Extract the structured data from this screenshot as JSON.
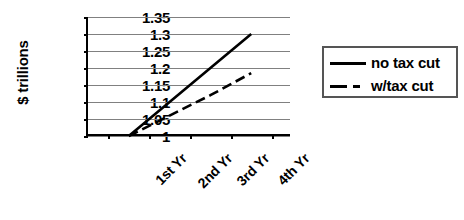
{
  "chart_data": {
    "type": "line",
    "title": "",
    "xlabel": "",
    "ylabel": "$ trillions",
    "categories": [
      "1st Yr",
      "2nd Yr",
      "3rd Yr",
      "4th Yr"
    ],
    "series": [
      {
        "name": "no tax cut",
        "style": "solid",
        "values": [
          1.0,
          1.1,
          1.2,
          1.3
        ]
      },
      {
        "name": "w/tax cut",
        "style": "dashed",
        "values": [
          1.0,
          1.06,
          1.12,
          1.185
        ]
      }
    ],
    "ylim": [
      1,
      1.35
    ],
    "yticks": [
      "1.35",
      "1.3",
      "1.25",
      "1.2",
      "1.15",
      "1.1",
      "1.05",
      "1"
    ],
    "ytick_values": [
      1.35,
      1.3,
      1.25,
      1.2,
      1.15,
      1.1,
      1.05,
      1
    ],
    "grid": true,
    "legend_position": "right",
    "colors": {
      "line": "#000000",
      "gridline": "#808080",
      "axis": "#000000",
      "background": "#ffffff",
      "legend_border": "#555555"
    }
  },
  "legend": {
    "entries": [
      {
        "label": "no tax cut",
        "style": "solid"
      },
      {
        "label": "w/tax cut",
        "style": "dashed"
      }
    ]
  },
  "axes": {
    "y_title": "$ trillions",
    "y_tick_labels": [
      "1.35",
      "1.3",
      "1.25",
      "1.2",
      "1.15",
      "1.1",
      "1.05",
      "1"
    ],
    "x_tick_labels": [
      "1st Yr",
      "2nd Yr",
      "3rd Yr",
      "4th Yr"
    ]
  }
}
